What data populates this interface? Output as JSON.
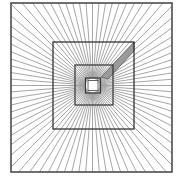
{
  "figure": {
    "title": "Radiating rays over concentric squares",
    "type": "geometric-illusion-diagram",
    "canvas": {
      "width": 183,
      "height": 180,
      "background": "#ffffff"
    },
    "center": {
      "x": 92.5,
      "y": 85.5
    },
    "colors": {
      "background": "#ffffff",
      "ray_stroke": "#808080",
      "square_stroke": "#333333",
      "border_stroke": "#4d4d4d",
      "wedge_fill": "#9a9a9a",
      "wedge_stroke": "#5a5a5a",
      "inner_fill": "#ffffff"
    },
    "rays": {
      "count": 80,
      "angle_step_degrees": 4.5,
      "start_angle_degrees": 0,
      "stroke_width": 0.7,
      "origin_radius": 7,
      "description": "Thin gray lines radiating outward from the center point to the outer square border"
    },
    "squares": [
      {
        "name": "outer-border-square",
        "x": 11,
        "y": 3,
        "width": 161,
        "height": 169,
        "stroke_width": 1.6,
        "stroke": "#4d4d4d",
        "fill": "none"
      },
      {
        "name": "second-square",
        "x": 53,
        "y": 42,
        "width": 81,
        "height": 87,
        "stroke_width": 1.3,
        "stroke": "#333333",
        "fill": "none"
      },
      {
        "name": "third-square",
        "x": 75,
        "y": 65,
        "width": 38,
        "height": 40,
        "stroke_width": 1.2,
        "stroke": "#333333",
        "fill": "none"
      },
      {
        "name": "fourth-square",
        "x": 85.5,
        "y": 78,
        "width": 15,
        "height": 15,
        "stroke_width": 1.1,
        "stroke": "#333333",
        "fill": "none"
      },
      {
        "name": "innermost-square",
        "x": 88,
        "y": 80.5,
        "width": 10,
        "height": 10,
        "stroke_width": 0.9,
        "stroke": "#555555",
        "fill": "#ffffff"
      }
    ],
    "wedge": {
      "name": "shaded-wedge",
      "fill": "#9a9a9a",
      "stroke": "#5a5a5a",
      "stroke_width": 0.8,
      "points": "101,77 134,42 134,51 108,79",
      "description": "Gray shaded quadrilateral sector extending from near the center up to the top-right corner of the second square"
    },
    "labels": {
      "caption": ""
    }
  }
}
